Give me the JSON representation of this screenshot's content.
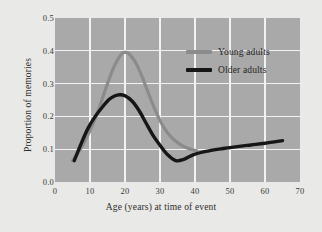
{
  "chart_data": {
    "type": "line",
    "title": "",
    "xlabel": "Age (years) at time of event",
    "ylabel": "Proportion of memories",
    "xlim": [
      0,
      70
    ],
    "ylim": [
      0.0,
      0.5
    ],
    "xticks": [
      "0",
      "10",
      "20",
      "30",
      "40",
      "50",
      "60",
      "70"
    ],
    "xtick_values": [
      0,
      10,
      20,
      30,
      40,
      50,
      60,
      70
    ],
    "yticks": [
      "0.0",
      "0.1",
      "0.2",
      "0.3",
      "0.4",
      "0.5"
    ],
    "ytick_values": [
      0.0,
      0.1,
      0.2,
      0.3,
      0.4,
      0.5
    ],
    "grid": true,
    "grid_color": "#f2f2f0",
    "plot_background": "#a9a9a9",
    "figure_background": "#e9e9e7",
    "legend_position": "upper right inside",
    "series": [
      {
        "name": "Young adults",
        "color": "#8b8b8b",
        "width": 3.2,
        "x": [
          5.0,
          7.0,
          9.0,
          11.0,
          13.0,
          15.0,
          17.0,
          19.0,
          20.0,
          21.0,
          23.0,
          25.0,
          27.0,
          29.0,
          31.0,
          33.0,
          35.0,
          37.0,
          39.0,
          40.5
        ],
        "values": [
          0.065,
          0.095,
          0.135,
          0.18,
          0.238,
          0.3,
          0.355,
          0.39,
          0.395,
          0.392,
          0.365,
          0.318,
          0.262,
          0.21,
          0.168,
          0.139,
          0.12,
          0.107,
          0.099,
          0.095
        ]
      },
      {
        "name": "Older adults",
        "color": "#161616",
        "width": 3.4,
        "x": [
          5.5,
          7.5,
          9.5,
          11.5,
          13.5,
          15.5,
          17.0,
          18.5,
          20.0,
          22.0,
          24.0,
          26.0,
          28.0,
          30.0,
          32.0,
          34.5,
          37.0,
          40.0,
          44.0,
          48.0,
          52.0,
          56.0,
          60.0,
          65.0
        ],
        "values": [
          0.065,
          0.118,
          0.165,
          0.2,
          0.228,
          0.252,
          0.262,
          0.266,
          0.263,
          0.247,
          0.218,
          0.18,
          0.142,
          0.112,
          0.085,
          0.065,
          0.07,
          0.085,
          0.095,
          0.102,
          0.108,
          0.113,
          0.118,
          0.126
        ]
      }
    ]
  },
  "legend": {
    "items": [
      {
        "label": "Young adults"
      },
      {
        "label": "Older adults"
      }
    ]
  }
}
